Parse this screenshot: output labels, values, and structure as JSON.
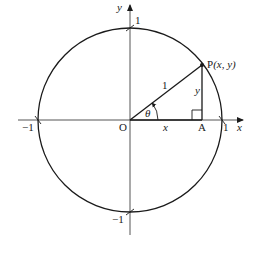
{
  "diagram": {
    "type": "unit-circle",
    "colors": {
      "stroke": "#1a1a1a",
      "axis": "#555555",
      "background": "#ffffff"
    },
    "axes": {
      "x_label": "x",
      "y_label": "y"
    },
    "ticks": {
      "x_neg": "−1",
      "x_pos": "1",
      "y_pos": "1",
      "y_neg": "−1"
    },
    "points": {
      "origin": "O",
      "foot": "A",
      "p_name": "P",
      "p_coords": "(x, y)"
    },
    "segments": {
      "hypotenuse": "1",
      "adjacent": "x",
      "opposite": "y"
    },
    "angle": "θ"
  }
}
